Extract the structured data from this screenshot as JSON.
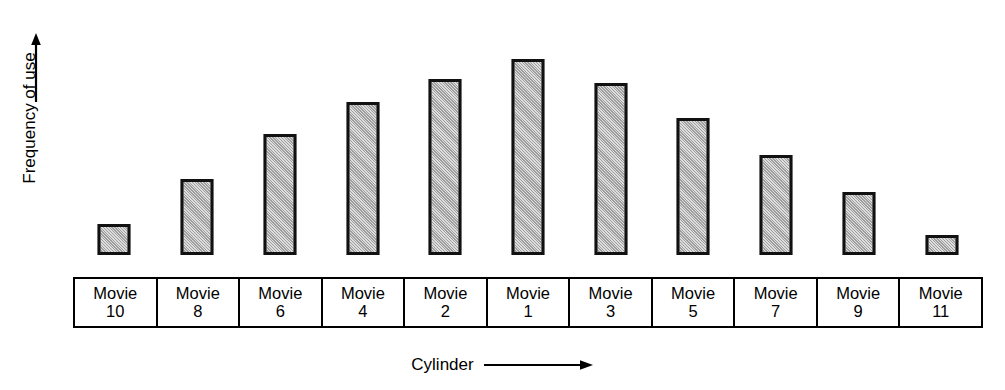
{
  "chart_data": {
    "type": "bar",
    "title": "",
    "xlabel": "Cylinder",
    "ylabel": "Frequency of use",
    "categories": [
      "Movie 10",
      "Movie 8",
      "Movie 6",
      "Movie 4",
      "Movie 2",
      "Movie 1",
      "Movie 3",
      "Movie 5",
      "Movie 7",
      "Movie 9",
      "Movie 11"
    ],
    "category_parts": [
      {
        "name": "Movie",
        "number": "10"
      },
      {
        "name": "Movie",
        "number": "8"
      },
      {
        "name": "Movie",
        "number": "6"
      },
      {
        "name": "Movie",
        "number": "4"
      },
      {
        "name": "Movie",
        "number": "2"
      },
      {
        "name": "Movie",
        "number": "1"
      },
      {
        "name": "Movie",
        "number": "3"
      },
      {
        "name": "Movie",
        "number": "5"
      },
      {
        "name": "Movie",
        "number": "7"
      },
      {
        "name": "Movie",
        "number": "9"
      },
      {
        "name": "Movie",
        "number": "11"
      }
    ],
    "values": [
      16,
      39,
      62,
      78,
      90,
      100,
      88,
      70,
      51,
      32,
      10
    ],
    "ylim": [
      0,
      115
    ],
    "grid": false,
    "legend": null,
    "axis_tick_labels": [],
    "bar_fill_color": "#b4b4b4",
    "bar_border_color": "#111111",
    "axis_arrow_color": "#000000"
  },
  "axes": {
    "y_title": "Frequency of use",
    "y_arrow_icon": "arrow-up-icon",
    "x_title": "Cylinder",
    "x_arrow_icon": "arrow-right-icon"
  }
}
